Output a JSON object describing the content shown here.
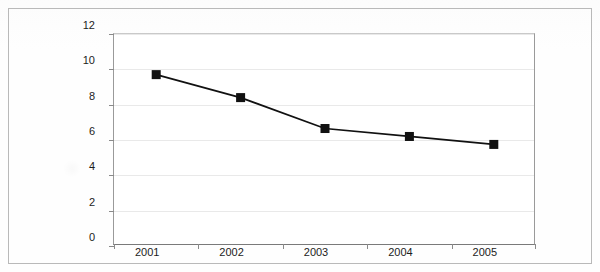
{
  "chart_data": {
    "type": "line",
    "title": "",
    "subtitle": "",
    "xlabel": "",
    "ylabel": "",
    "categories": [
      "2001",
      "2002",
      "2003",
      "2004",
      "2005"
    ],
    "values": [
      9.7,
      8.4,
      6.65,
      6.2,
      5.75
    ],
    "series": [
      {
        "name": "Series 1",
        "values": [
          9.7,
          8.4,
          6.65,
          6.2,
          5.75
        ]
      }
    ],
    "ylim": [
      0,
      12
    ],
    "ytick_labels": [
      "0",
      "2",
      "4",
      "6",
      "8",
      "10",
      "12"
    ],
    "ytick_values": [
      0,
      2,
      4,
      6,
      8,
      10,
      12
    ],
    "grid": true,
    "grid_axis": "y",
    "legend": false,
    "legend_position": "none",
    "marker": "square",
    "marker_color": "#111111",
    "line_color": "#111111",
    "gridline_color": "#e9e9e9",
    "axis_color": "#8a8a8a",
    "plot_background": "#ffffff",
    "frame_border_color": "#b9b9b9",
    "annotations": []
  }
}
